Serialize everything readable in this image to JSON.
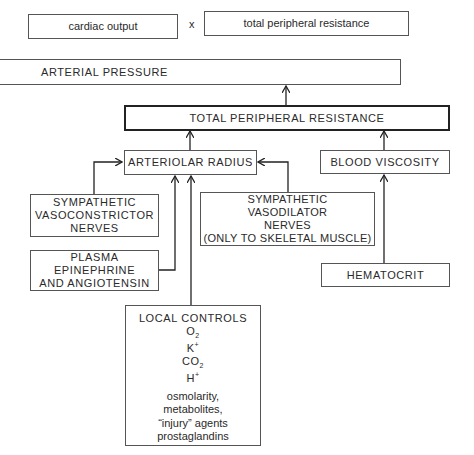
{
  "diagram": {
    "equation": {
      "left": "cardiac output",
      "operator": "x",
      "right": "total peripheral resistance"
    },
    "nodes": {
      "arterial_pressure": "ARTERIAL PRESSURE",
      "total_peripheral_resistance": "TOTAL PERIPHERAL RESISTANCE",
      "arteriolar_radius": "ARTERIOLAR RADIUS",
      "blood_viscosity": "BLOOD VISCOSITY",
      "vasoconstrictor": {
        "lines": [
          "SYMPATHETIC",
          "VASOCONSTRICTOR",
          "NERVES"
        ]
      },
      "vasodilator": {
        "lines": [
          "SYMPATHETIC",
          "VASODILATOR",
          "NERVES",
          "(ONLY TO SKELETAL MUSCLE)"
        ]
      },
      "plasma": {
        "lines": [
          "PLASMA",
          "EPINEPHRINE",
          "AND ANGIOTENSIN"
        ]
      },
      "hematocrit": "HEMATOCRIT",
      "local_controls": {
        "title": "LOCAL CONTROLS",
        "ions": [
          {
            "base": "O",
            "sub": "2",
            "sup": ""
          },
          {
            "base": "K",
            "sub": "",
            "sup": "+"
          },
          {
            "base": "CO",
            "sub": "2",
            "sup": ""
          },
          {
            "base": "H",
            "sub": "",
            "sup": "+"
          }
        ],
        "other": [
          "osmolarity,",
          "metabolites,",
          "“injury” agents",
          "prostaglandins"
        ]
      }
    },
    "edges": [
      {
        "from": "total_peripheral_resistance",
        "to": "arterial_pressure"
      },
      {
        "from": "arteriolar_radius",
        "to": "total_peripheral_resistance"
      },
      {
        "from": "blood_viscosity",
        "to": "total_peripheral_resistance"
      },
      {
        "from": "vasoconstrictor",
        "to": "arteriolar_radius"
      },
      {
        "from": "vasodilator",
        "to": "arteriolar_radius"
      },
      {
        "from": "plasma",
        "to": "arteriolar_radius"
      },
      {
        "from": "local_controls",
        "to": "arteriolar_radius"
      },
      {
        "from": "hematocrit",
        "to": "blood_viscosity"
      }
    ],
    "colors": {
      "line": "#222222",
      "box_border": "#555555",
      "text": "#2a2a2a",
      "background": "#ffffff"
    }
  }
}
